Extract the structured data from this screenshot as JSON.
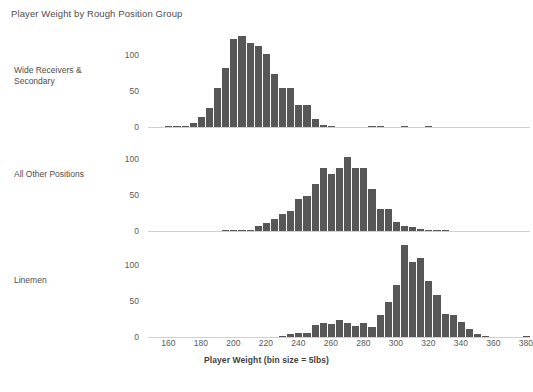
{
  "chart_data": {
    "type": "bar",
    "title": "Player Weight by Rough Position Group",
    "xlabel": "Player Weight (bin size = 5lbs)",
    "ylabel": "",
    "bin_size": 5,
    "xlim": [
      150,
      385
    ],
    "xticks": [
      160,
      180,
      200,
      220,
      240,
      260,
      280,
      300,
      320,
      340,
      360,
      380
    ],
    "yticks": [
      0,
      50,
      100
    ],
    "ylim": [
      0,
      135
    ],
    "grid": false,
    "legend": "none",
    "bar_color": "#575757",
    "panels": [
      {
        "name": "Wide Receivers & Secondary",
        "label": "Wide Receivers &\nSecondary",
        "x": [
          160,
          165,
          170,
          175,
          180,
          185,
          190,
          195,
          200,
          205,
          210,
          215,
          220,
          225,
          230,
          235,
          240,
          245,
          250,
          255,
          260,
          265,
          270,
          275,
          280,
          285,
          290,
          295,
          300,
          305,
          310,
          315,
          320
        ],
        "values": [
          1,
          1,
          2,
          6,
          14,
          27,
          54,
          82,
          122,
          126,
          117,
          112,
          101,
          73,
          54,
          54,
          30,
          30,
          11,
          3,
          1,
          0,
          0,
          0,
          0,
          1,
          1,
          0,
          0,
          1,
          0,
          0,
          1
        ]
      },
      {
        "name": "All Other Positions",
        "label": "All Other Positions",
        "x": [
          195,
          200,
          205,
          210,
          215,
          220,
          225,
          230,
          235,
          240,
          245,
          250,
          255,
          260,
          265,
          270,
          275,
          280,
          285,
          290,
          295,
          300,
          305,
          310,
          315,
          320,
          325,
          330
        ],
        "values": [
          1,
          1,
          2,
          2,
          7,
          11,
          17,
          23,
          28,
          45,
          48,
          65,
          88,
          79,
          88,
          103,
          88,
          87,
          59,
          31,
          31,
          13,
          7,
          5,
          3,
          1,
          1,
          1
        ]
      },
      {
        "name": "Linemen",
        "label": "Linemen",
        "x": [
          230,
          235,
          240,
          245,
          250,
          255,
          260,
          265,
          270,
          275,
          280,
          285,
          290,
          295,
          300,
          305,
          310,
          315,
          320,
          325,
          330,
          335,
          340,
          345,
          350,
          355,
          380
        ],
        "values": [
          1,
          4,
          5,
          6,
          17,
          19,
          18,
          23,
          19,
          15,
          20,
          14,
          30,
          48,
          72,
          128,
          104,
          110,
          78,
          58,
          32,
          30,
          21,
          11,
          4,
          1,
          1
        ]
      }
    ]
  }
}
